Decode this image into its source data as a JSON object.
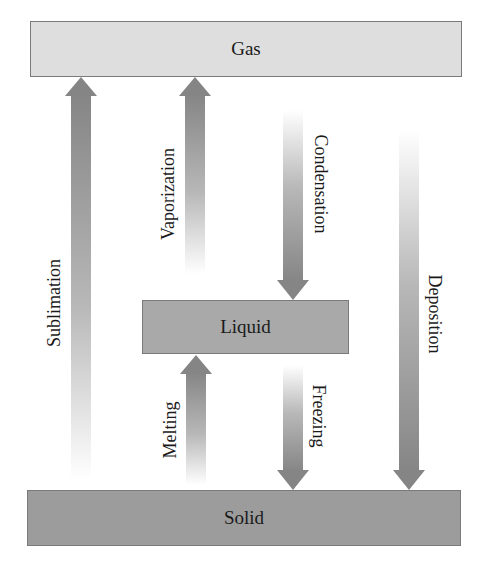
{
  "states": {
    "gas": "Gas",
    "liquid": "Liquid",
    "solid": "Solid"
  },
  "transitions": {
    "sublimation": {
      "label": "Sublimation",
      "from": "Solid",
      "to": "Gas"
    },
    "vaporization": {
      "label": "Vaporization",
      "from": "Liquid",
      "to": "Gas"
    },
    "condensation": {
      "label": "Condensation",
      "from": "Gas",
      "to": "Liquid"
    },
    "deposition": {
      "label": "Deposition",
      "from": "Gas",
      "to": "Solid"
    },
    "melting": {
      "label": "Melting",
      "from": "Solid",
      "to": "Liquid"
    },
    "freezing": {
      "label": "Freezing",
      "from": "Liquid",
      "to": "Solid"
    }
  },
  "colors": {
    "gas_fill": "#dedede",
    "liquid_fill": "#a9a9a9",
    "solid_fill": "#9c9c9c",
    "arrow": "#8a8a8a",
    "border": "#7a7a7a"
  }
}
